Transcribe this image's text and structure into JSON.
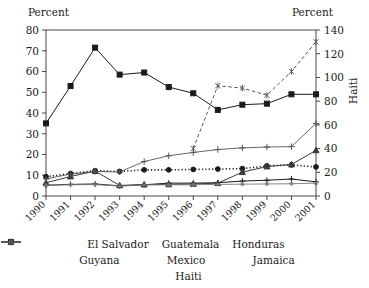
{
  "chart_data": {
    "type": "line",
    "title": "",
    "xlabel": "",
    "ylabel": "Percent",
    "y2label": "Percent",
    "y2_series_label": "Haiti",
    "grid": false,
    "legend_position": "bottom",
    "ylim": [
      0,
      80
    ],
    "y2lim": [
      0,
      140
    ],
    "yticks": [
      0,
      10,
      20,
      30,
      40,
      50,
      60,
      70,
      80
    ],
    "y2ticks": [
      0,
      20,
      40,
      60,
      80,
      100,
      120,
      140
    ],
    "categories": [
      "1990",
      "1991",
      "1992",
      "1993",
      "1994",
      "1995",
      "1996",
      "1997",
      "1998",
      "1999",
      "2000",
      "2001"
    ],
    "series": [
      {
        "name": "El Salvador",
        "axis": "left",
        "marker": "square",
        "dash": "solid",
        "values": [
          35,
          53,
          71.5,
          58.5,
          59.5,
          52.5,
          49.5,
          41.5,
          44,
          44.5,
          49,
          49
        ]
      },
      {
        "name": "Guatemala",
        "axis": "left",
        "marker": "circle",
        "dash": "dotted",
        "values": [
          9.3,
          10.8,
          12.2,
          11.8,
          12.6,
          12.6,
          12.8,
          13,
          13.2,
          14.5,
          15,
          14
        ]
      },
      {
        "name": "Honduras",
        "axis": "left",
        "marker": "plus-bar",
        "dash": "solid",
        "values": [
          5.2,
          5.6,
          5.8,
          4.9,
          5.4,
          6.2,
          6.2,
          6.4,
          7.2,
          7.6,
          8.2,
          6.8
        ]
      },
      {
        "name": "Guyana",
        "axis": "left",
        "marker": "triangle",
        "dash": "solid",
        "values": [
          6.4,
          9.4,
          12,
          5.1,
          5.5,
          5.6,
          5.8,
          6.2,
          11.5,
          14.2,
          15.2,
          22
        ]
      },
      {
        "name": "Mexico",
        "axis": "left",
        "marker": "star",
        "dash": "solid",
        "values": [
          5.2,
          5.4,
          5.5,
          4.8,
          5.3,
          5.4,
          5.4,
          5.6,
          5.7,
          5.8,
          5.9,
          6.2
        ]
      },
      {
        "name": "Jamaica",
        "axis": "left",
        "marker": "plus",
        "dash": "solid",
        "values": [
          8.2,
          10.6,
          11.8,
          11.6,
          16.6,
          19.4,
          21,
          22.4,
          23.2,
          23.6,
          23.8,
          35
        ]
      },
      {
        "name": "Haiti",
        "axis": "right",
        "marker": "cross",
        "dash": "dashed",
        "values": [
          null,
          null,
          null,
          null,
          null,
          null,
          40,
          93,
          91,
          85,
          105,
          130
        ]
      }
    ]
  },
  "legend": {
    "items": [
      {
        "label": "El Salvador"
      },
      {
        "label": "Guatemala"
      },
      {
        "label": "Honduras"
      },
      {
        "label": "Guyana"
      },
      {
        "label": "Mexico"
      },
      {
        "label": "Jamaica"
      },
      {
        "label": "Haiti"
      }
    ]
  },
  "colors": {
    "dark": "#1a1a1a",
    "mid": "#555555",
    "light": "#777777",
    "axis": "#333333",
    "background": "#ffffff"
  }
}
